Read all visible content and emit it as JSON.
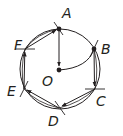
{
  "diagram": {
    "circle": {
      "cx": 60,
      "cy": 69,
      "r": 40
    },
    "center": {
      "label": "O",
      "x": 59,
      "y": 70,
      "label_x": 42,
      "label_y": 86
    },
    "points": [
      {
        "label": "A",
        "x": 59,
        "y": 29,
        "label_x": 62,
        "label_y": 18
      },
      {
        "label": "B",
        "x": 94,
        "y": 49,
        "label_x": 101,
        "label_y": 54
      },
      {
        "label": "C",
        "x": 95,
        "y": 89,
        "label_x": 96,
        "label_y": 106
      },
      {
        "label": "D",
        "x": 59,
        "y": 108,
        "label_x": 48,
        "label_y": 126
      },
      {
        "label": "E",
        "x": 24,
        "y": 89,
        "label_x": 7,
        "label_y": 96
      },
      {
        "label": "F",
        "x": 25,
        "y": 49,
        "label_x": 14,
        "label_y": 50
      }
    ],
    "colors": {
      "stroke": "#231f20",
      "background": "#ffffff"
    }
  }
}
